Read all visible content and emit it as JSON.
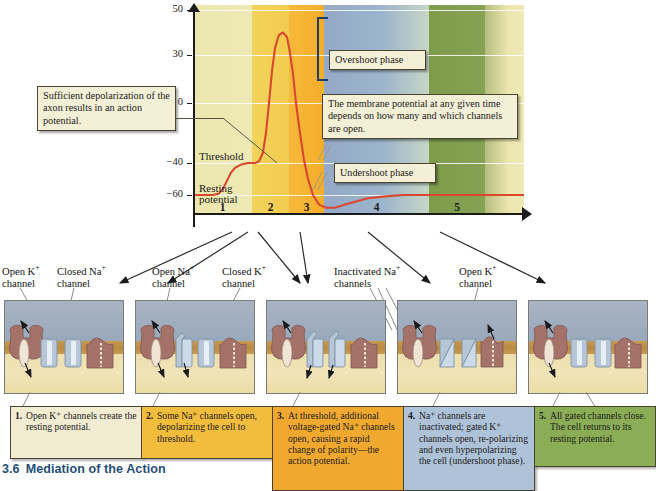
{
  "figure": {
    "number": "3.6",
    "title": "Mediation of the Action"
  },
  "chart_data": {
    "type": "line",
    "xlabel": "",
    "ylabel": "",
    "ylim": [
      -75,
      50
    ],
    "y_ticks": [
      "50",
      "30",
      "0",
      "-40",
      "-60"
    ],
    "y_tick_values": [
      50,
      30,
      0,
      -40,
      -60
    ],
    "grid": true,
    "resting_potential_mv": -60,
    "threshold_mv": -40,
    "peak_mv": 40,
    "undershoot_mv": -68,
    "series": [
      {
        "name": "Membrane potential (mV)",
        "color": "#d9472f",
        "points": [
          [
            0,
            -60
          ],
          [
            12,
            -60
          ],
          [
            20,
            -60
          ],
          [
            26,
            -59
          ],
          [
            30,
            -56
          ],
          [
            34,
            -51
          ],
          [
            38,
            -46
          ],
          [
            42,
            -43
          ],
          [
            48,
            -41
          ],
          [
            55,
            -40
          ],
          [
            62,
            -40
          ],
          [
            66,
            -39
          ],
          [
            70,
            -33
          ],
          [
            73,
            -20
          ],
          [
            76,
            0
          ],
          [
            79,
            20
          ],
          [
            82,
            33
          ],
          [
            86,
            39
          ],
          [
            90,
            40
          ],
          [
            94,
            38
          ],
          [
            97,
            31
          ],
          [
            100,
            18
          ],
          [
            103,
            0
          ],
          [
            107,
            -20
          ],
          [
            111,
            -38
          ],
          [
            115,
            -50
          ],
          [
            120,
            -60
          ],
          [
            126,
            -66
          ],
          [
            133,
            -68
          ],
          [
            142,
            -68
          ],
          [
            152,
            -66
          ],
          [
            163,
            -64
          ],
          [
            175,
            -62
          ],
          [
            190,
            -61
          ],
          [
            210,
            -60
          ],
          [
            240,
            -60
          ],
          [
            280,
            -60
          ],
          [
            331,
            -60
          ]
        ]
      }
    ],
    "phases": [
      {
        "number": "1",
        "color": "#ede8b0"
      },
      {
        "number": "2",
        "color": "#f2cf55"
      },
      {
        "number": "3",
        "color": "#f5b333"
      },
      {
        "number": "4",
        "color": "#8fabc9"
      },
      {
        "number": "5",
        "color": "#7d9c4a"
      }
    ],
    "inline_labels": [
      {
        "text": "Threshold",
        "value_mv": -40
      },
      {
        "text": "Resting potential",
        "value_mv": -60
      }
    ],
    "annotations": [
      {
        "text": "Overshoot phase"
      },
      {
        "text": "Undershoot phase"
      },
      {
        "text": "Sufficient depolarization of the axon results in an action potential."
      },
      {
        "text": "The membrane potential at any given time depends on how many and which channels are open."
      }
    ]
  },
  "graph": {
    "callouts": {
      "depolarization": "Sufficient depolarization of the axon results in an action potential.",
      "membrane_potential": "The membrane potential at any given time depends on how many and which channels are open.",
      "overshoot": "Overshoot phase",
      "undershoot": "Undershoot phase"
    },
    "inline": {
      "threshold": "Threshold",
      "resting_line1": "Resting",
      "resting_line2": "potential"
    },
    "y_axis": {
      "t50": "50",
      "t30": "30",
      "t0": "0",
      "tm40": "−40",
      "tm60": "−60"
    },
    "phase_numbers": {
      "p1": "1",
      "p2": "2",
      "p3": "3",
      "p4": "4",
      "p5": "5"
    }
  },
  "channel_labels": [
    {
      "line1": "Open K",
      "sup": "+",
      "line2": "channel"
    },
    {
      "line1": "Closed Na",
      "sup": "+",
      "line2": "channel"
    },
    {
      "line1": "Open Na",
      "sup": "+",
      "line2": "channel"
    },
    {
      "line1": "Closed K",
      "sup": "+",
      "line2": "channel"
    },
    {
      "line1": "Inactivated Na",
      "sup": "+",
      "line2": "channels"
    },
    {
      "line1": "Open K",
      "sup": "+",
      "line2": "channel"
    }
  ],
  "panel_captions": [
    {
      "number": "1.",
      "text": "Open K⁺ channels create the resting potential.",
      "bg": "#f2ecd2",
      "border": "#4a4332"
    },
    {
      "number": "2.",
      "text": "Some Na⁺ channels open, depolarizing the cell to threshold.",
      "bg": "#f2bc3c",
      "border": "#4a4332"
    },
    {
      "number": "3.",
      "text": "At threshold, additional voltage-gated Na⁺ channels open, causing a rapid change of polarity—the action potential.",
      "bg": "#f0a92e",
      "border": "#4a4332"
    },
    {
      "number": "4.",
      "text": "Na⁺ channels are inactivated; gated K⁺ channels open, re-polarizing and even hyperpolarizing the cell (undershoot phase).",
      "bg": "#aec2d8",
      "border": "#4a4332"
    },
    {
      "number": "5.",
      "text": "All gated channels close. The cell returns to its resting potential.",
      "bg": "#8aad56",
      "border": "#4a4332"
    }
  ],
  "colors": {
    "curve": "#d9472f",
    "caption_heading": "#1f4e79",
    "membrane": "#c08b42",
    "extracellular": "#a2afc0",
    "intracellular": "#efe2b0",
    "protein": "#a5726a",
    "channel": "#b7c6d6",
    "na_ion": "#3a77a8",
    "k_ion": "#e8d9a8"
  }
}
